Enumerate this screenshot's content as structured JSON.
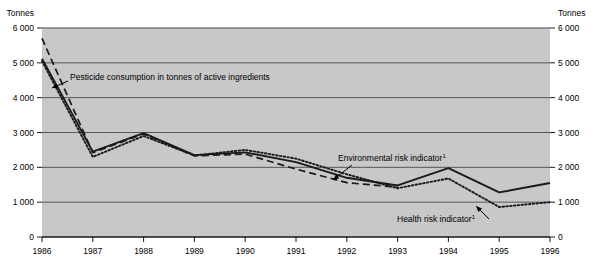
{
  "chart_data": {
    "type": "line",
    "title": "",
    "xlabel": "",
    "ylabel": "Tonnes",
    "ylabel_right": "Tonnes",
    "x": [
      1986,
      1987,
      1988,
      1989,
      1990,
      1991,
      1992,
      1993,
      1994,
      1995,
      1996
    ],
    "categories": [
      "1986",
      "1987",
      "1988",
      "1989",
      "1990",
      "1991",
      "1992",
      "1993",
      "1994",
      "1995",
      "1996"
    ],
    "ylim": [
      0,
      6000
    ],
    "ytick_values": [
      0,
      1000,
      2000,
      3000,
      4000,
      5000,
      6000
    ],
    "ytick_labels": [
      "0",
      "1 000",
      "2 000",
      "3 000",
      "4 000",
      "5 000",
      "6 000"
    ],
    "grid": true,
    "legend_position": "inline-annotations",
    "plot_background": "#c8c8c8",
    "series": [
      {
        "name": "Environmental risk indicator",
        "style": "solid",
        "color": "#1a1a1a",
        "values": [
          5120,
          2450,
          2980,
          2350,
          2430,
          2150,
          1700,
          1480,
          1980,
          1280,
          1550
        ]
      },
      {
        "name": "Health risk indicator",
        "style": "dotted",
        "color": "#1a1a1a",
        "values": [
          5050,
          2300,
          2900,
          2340,
          2500,
          2250,
          1800,
          1400,
          1680,
          860,
          1000
        ]
      },
      {
        "name": "Pesticide consumption in tonnes of active ingredients",
        "style": "dashed",
        "color": "#1a1a1a",
        "values": [
          5700,
          2420,
          2960,
          2330,
          2380,
          1950,
          1560,
          1430,
          null,
          null,
          null
        ]
      }
    ],
    "annotations": [
      {
        "id": "pesticide-annotation",
        "text": "Pesticide consumption in tonnes of active ingredients",
        "footnote": "",
        "text_x": 70,
        "text_y": 80,
        "arrow_from_x": 68,
        "arrow_from_y": 81,
        "arrow_to_x": 52,
        "arrow_to_y": 88
      },
      {
        "id": "environmental-annotation",
        "text": "Environmental risk indicator",
        "footnote": "1",
        "text_x": 338,
        "text_y": 161,
        "arrow_from_x": 352,
        "arrow_from_y": 165,
        "arrow_to_x": 333,
        "arrow_to_y": 180
      },
      {
        "id": "health-annotation",
        "text": "Health risk indicator",
        "footnote": "1",
        "text_x": 397,
        "text_y": 222,
        "arrow_from_x": 489,
        "arrow_from_y": 219,
        "arrow_to_x": 476,
        "arrow_to_y": 206
      }
    ]
  },
  "axes": {
    "left_unit": "Tonnes",
    "right_unit": "Tonnes"
  }
}
